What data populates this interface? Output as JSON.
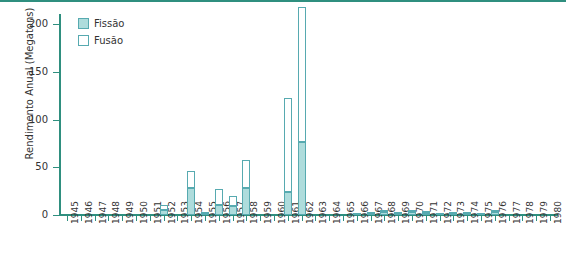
{
  "chart_data": {
    "type": "bar",
    "title": "",
    "subtitle": "",
    "xlabel": "",
    "ylabel": "Rendimento Anual  (Megatons)",
    "stacked": true,
    "grid": false,
    "legend_position": "top-left",
    "ylim": [
      0,
      200
    ],
    "yticks": [
      0,
      50,
      100,
      150,
      200
    ],
    "ytick_labels": [
      "0",
      "50",
      "100",
      "150",
      "200"
    ],
    "xlim": [
      "1945",
      "1980"
    ],
    "categories": [
      "1945",
      "1946",
      "1947",
      "1948",
      "1949",
      "1950",
      "1951",
      "1952",
      "1953",
      "1954",
      "1955",
      "1956",
      "1957",
      "1958",
      "1959",
      "1960",
      "1961",
      "1962",
      "1963",
      "1964",
      "1965",
      "1966",
      "1967",
      "1968",
      "1969",
      "1970",
      "1971",
      "1972",
      "1973",
      "1974",
      "1975",
      "1976",
      "1977",
      "1978",
      "1979",
      "1980"
    ],
    "series": [
      {
        "name": "Fissão",
        "color": "#aedcdc",
        "values": [
          0,
          0,
          0,
          0,
          0,
          0,
          0,
          5.5,
          0,
          28,
          1.5,
          11,
          9.5,
          28,
          0,
          0,
          24,
          76,
          0,
          0,
          0,
          0.6,
          1.2,
          3,
          1.2,
          3,
          1.6,
          0.5,
          1.5,
          1.2,
          0.6,
          3,
          0,
          0,
          0,
          0
        ]
      },
      {
        "name": "Fusão",
        "color": "#ffffff",
        "values": [
          0,
          0,
          0,
          0,
          0,
          0,
          0,
          5.5,
          0,
          18,
          1.5,
          16,
          10.5,
          30,
          0,
          0,
          99,
          142,
          0,
          0,
          0,
          0,
          0.3,
          2,
          0.3,
          2,
          0.4,
          0,
          0.5,
          0.3,
          0,
          2,
          0,
          0,
          0,
          0
        ]
      }
    ],
    "totals": [
      0,
      0,
      0,
      0,
      0,
      0,
      0,
      11,
      0,
      46,
      3,
      27,
      20,
      58,
      0,
      0,
      123,
      218,
      0,
      0,
      0,
      0.6,
      1.5,
      5,
      1.5,
      5,
      2,
      0.5,
      2,
      1.5,
      0.6,
      5,
      0,
      0,
      0,
      0
    ],
    "legend": [
      {
        "label": "Fissão",
        "swatch": "filled"
      },
      {
        "label": "Fusão",
        "swatch": "empty"
      }
    ],
    "colors": {
      "accent": "#2f8f7f",
      "fissao_fill": "#aedcdc",
      "bar_stroke": "#57aab0",
      "text": "#333333",
      "background": "#ffffff"
    }
  }
}
